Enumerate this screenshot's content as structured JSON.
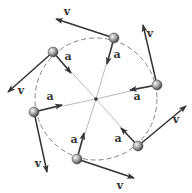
{
  "diagram": {
    "center": {
      "x": 96,
      "y": 99
    },
    "radius": 61,
    "colors": {
      "background": "#ffffff",
      "circle": "#777777",
      "radial_line": "#aaaaaa",
      "arrow": "#333333",
      "ball_light": "#f0f0f0",
      "ball_dark": "#555555"
    },
    "velocity_label": "v",
    "acceleration_label": "a",
    "particles": [
      {
        "id": "upper-left",
        "x": 53,
        "y": 52,
        "v_tip": [
          8,
          92
        ],
        "a_tip": [
          71,
          73
        ],
        "v_label": [
          21,
          94
        ],
        "a_label": [
          68,
          60
        ]
      },
      {
        "id": "top",
        "x": 114,
        "y": 38,
        "v_tip": [
          56,
          19
        ],
        "a_tip": [
          107,
          64
        ],
        "v_label": [
          67,
          15
        ],
        "a_label": [
          117,
          58
        ]
      },
      {
        "id": "right",
        "x": 157,
        "y": 85,
        "v_tip": [
          143,
          25
        ],
        "a_tip": [
          130,
          90
        ],
        "v_label": [
          150,
          37
        ],
        "a_label": [
          137,
          100
        ]
      },
      {
        "id": "lower-right",
        "x": 138,
        "y": 146,
        "v_tip": [
          186,
          106
        ],
        "a_tip": [
          121,
          128
        ],
        "v_label": [
          176,
          123
        ],
        "a_label": [
          118,
          142
        ]
      },
      {
        "id": "bottom",
        "x": 77,
        "y": 159,
        "v_tip": [
          134,
          178
        ],
        "a_tip": [
          84,
          133
        ],
        "v_label": [
          120,
          189
        ],
        "a_label": [
          74,
          143
        ]
      },
      {
        "id": "left",
        "x": 34,
        "y": 112,
        "v_tip": [
          47,
          172
        ],
        "a_tip": [
          62,
          105
        ],
        "v_label": [
          38,
          167
        ],
        "a_label": [
          50,
          100
        ]
      }
    ]
  }
}
